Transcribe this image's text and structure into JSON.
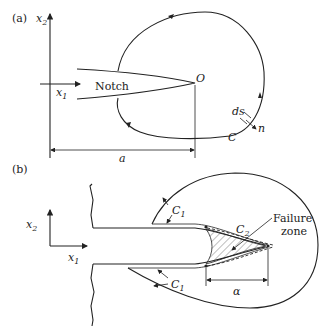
{
  "panel_a": {
    "label": "(a)",
    "axis_x2": "x",
    "axis_x2_sub": "2",
    "axis_x1": "x",
    "axis_x1_sub": "1",
    "notch_label": "Notch",
    "origin_label": "O",
    "contour_label": "C",
    "ds_label": "ds",
    "normal_label": "n",
    "length_label": "a"
  },
  "panel_b": {
    "label": "(b)",
    "axis_x2": "x",
    "axis_x2_sub": "2",
    "axis_x1": "x",
    "axis_x1_sub": "1",
    "contour_c1_top": "C",
    "contour_c1_top_sub": "1",
    "contour_c1_bottom": "C",
    "contour_c1_bottom_sub": "1",
    "contour_c2": "C",
    "contour_c2_sub": "2",
    "failure_zone_line1": "Failure",
    "failure_zone_line2": "zone",
    "alpha_label": "α"
  }
}
